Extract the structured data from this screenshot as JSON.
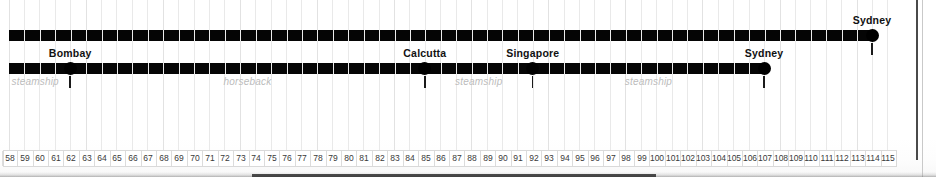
{
  "axis": {
    "start": 58,
    "end": 115,
    "ticks": [
      58,
      59,
      60,
      61,
      62,
      63,
      64,
      65,
      66,
      67,
      68,
      69,
      70,
      71,
      72,
      73,
      74,
      75,
      76,
      77,
      78,
      79,
      80,
      81,
      82,
      83,
      84,
      85,
      86,
      87,
      88,
      89,
      90,
      91,
      92,
      93,
      94,
      95,
      96,
      97,
      98,
      99,
      100,
      101,
      102,
      103,
      104,
      105,
      106,
      107,
      108,
      109,
      110,
      111,
      112,
      113,
      114,
      115
    ],
    "label": ""
  },
  "chart_data": {
    "type": "bar",
    "title": "",
    "xlabel": "",
    "ylabel": "",
    "xlim": [
      58,
      115
    ],
    "grid": true,
    "legend": "none",
    "series": [
      {
        "name": "upper-route",
        "row": "upper",
        "start": 58,
        "end": 114,
        "markers": [
          {
            "label": "Sydney",
            "value": 114,
            "endpoint": true
          }
        ],
        "modes": []
      },
      {
        "name": "lower-route",
        "row": "lower",
        "start": 58,
        "end": 107,
        "markers": [
          {
            "label": "Bombay",
            "value": 62,
            "endpoint": false
          },
          {
            "label": "Calcutta",
            "value": 85,
            "endpoint": false
          },
          {
            "label": "Singapore",
            "value": 92,
            "endpoint": false
          },
          {
            "label": "Sydney",
            "value": 107,
            "endpoint": true
          }
        ],
        "modes": [
          {
            "label": "steamship",
            "from": 58,
            "to": 62
          },
          {
            "label": "horseback",
            "from": 62,
            "to": 85
          },
          {
            "label": "steamship",
            "from": 85,
            "to": 92
          },
          {
            "label": "steamship",
            "from": 92,
            "to": 107
          }
        ]
      }
    ]
  },
  "markers": {
    "bombay": "Bombay",
    "calcutta": "Calcutta",
    "singapore": "Singapore",
    "sydney_lower": "Sydney",
    "sydney_upper": "Sydney"
  },
  "modes": {
    "steamship_1": "steamship",
    "horseback": "horseback",
    "steamship_2": "steamship",
    "steamship_3": "steamship"
  },
  "colors": {
    "bar": "#050505",
    "mode_text": "#bcbcbc",
    "city_text": "#111111",
    "grid": "#e9e9e9",
    "axis_text": "#3a3a3a"
  }
}
